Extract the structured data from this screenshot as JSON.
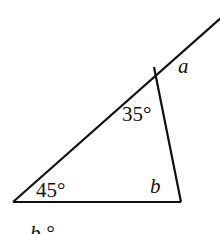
{
  "diagram": {
    "type": "triangle with exterior angle",
    "labels": {
      "angle_bottom_left": "45°",
      "angle_top": "35°",
      "angle_bottom_right": "b",
      "exterior_angle": "a",
      "caption_partial": "b °"
    },
    "stroke_color": "#111111"
  }
}
